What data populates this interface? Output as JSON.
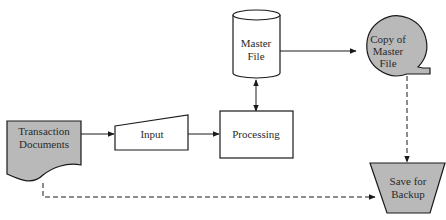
{
  "diagram": {
    "type": "system-flowchart",
    "nodes": {
      "transaction_documents": {
        "line1": "Transaction",
        "line2": "Documents",
        "shape": "document"
      },
      "input": {
        "label": "Input",
        "shape": "manual-input"
      },
      "processing": {
        "label": "Processing",
        "shape": "process"
      },
      "master_file": {
        "line1": "Master",
        "line2": "File",
        "shape": "disk-storage"
      },
      "copy_master_file": {
        "line1": "Copy of",
        "line2": "Master",
        "line3": "File",
        "shape": "magnetic-tape"
      },
      "save_backup": {
        "line1": "Save for",
        "line2": "Backup",
        "shape": "offline-storage"
      }
    },
    "edges": [
      {
        "from": "Transaction Documents",
        "to": "Input",
        "style": "solid"
      },
      {
        "from": "Input",
        "to": "Processing",
        "style": "solid"
      },
      {
        "from": "Processing",
        "to": "Master File",
        "style": "solid",
        "bidirectional": true
      },
      {
        "from": "Master File",
        "to": "Copy of Master File",
        "style": "solid"
      },
      {
        "from": "Copy of Master File",
        "to": "Save for Backup",
        "style": "dashed"
      },
      {
        "from": "Transaction Documents",
        "to": "Save for Backup",
        "style": "dashed"
      }
    ],
    "colors": {
      "fill_grey": "#b9b9b9",
      "stroke": "#1a1a1a"
    }
  }
}
